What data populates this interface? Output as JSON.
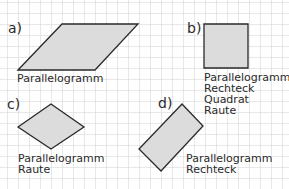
{
  "figure": {
    "grid": {
      "spacing_px": 11,
      "color": "#cfcfcf"
    },
    "shape_fill": "#dcdcdc",
    "shape_stroke": "#2a2a2a",
    "panels": [
      {
        "label": "a)",
        "shape": "parallelogram",
        "names": [
          "Parallelogramm"
        ]
      },
      {
        "label": "b)",
        "shape": "square",
        "names": [
          "Parallelogramm",
          "Rechteck",
          "Quadrat",
          "Raute"
        ]
      },
      {
        "label": "c)",
        "shape": "rhombus",
        "names": [
          "Parallelogramm",
          "Raute"
        ]
      },
      {
        "label": "d)",
        "shape": "rectangle-rotated",
        "names": [
          "Parallelogramm",
          "Rechteck"
        ]
      }
    ]
  }
}
